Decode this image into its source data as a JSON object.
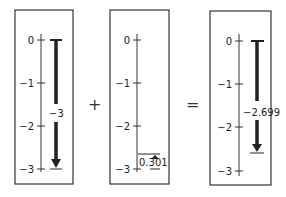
{
  "panels": [
    {
      "id": "left",
      "tick_labels": [
        "0",
        "−1",
        "−2",
        "−3"
      ],
      "arrow_label": "−3",
      "arrow_from": 0,
      "arrow_to": -3
    },
    {
      "id": "middle",
      "tick_labels": [
        "0",
        "−1",
        "−2",
        "−3"
      ],
      "arrow_label": "0.301",
      "arrow_from": -3,
      "arrow_to": -2.699
    },
    {
      "id": "right",
      "tick_labels": [
        "0",
        "−1",
        "−2",
        "−3"
      ],
      "arrow_label": "−2.699",
      "arrow_from": 0,
      "arrow_to": -2.699
    }
  ],
  "operators": {
    "plus": "+",
    "equals": "="
  }
}
